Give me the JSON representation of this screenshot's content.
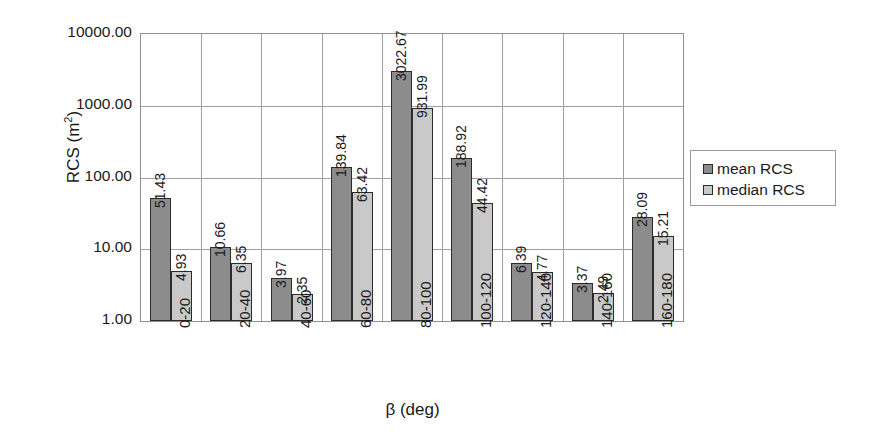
{
  "chart_data": {
    "type": "bar",
    "title": "",
    "subtitle": "",
    "xlabel": "β (deg)",
    "ylabel": "RCS (m²)",
    "ylabel_base": "RCS (m",
    "ylabel_sup": "2",
    "ylabel_close": ")",
    "yscale": "log",
    "ylim": [
      1,
      10000
    ],
    "ytick_labels": [
      "10000.00",
      "1000.00",
      "100.00",
      "10.00",
      "1.00"
    ],
    "ytick_values": [
      10000,
      1000,
      100,
      10,
      1
    ],
    "grid": true,
    "grid_axis": "both",
    "legend_position": "right",
    "categories": [
      "0-20",
      "20-40",
      "40-60",
      "60-80",
      "80-100",
      "100-120",
      "120-140",
      "140-160",
      "160-180"
    ],
    "series": [
      {
        "name": "mean RCS",
        "color": "#8c8c8c",
        "values": [
          51.43,
          10.66,
          3.97,
          139.84,
          3022.67,
          188.92,
          6.39,
          3.37,
          28.09
        ],
        "labels": [
          "51.43",
          "10.66",
          "3.97",
          "139.84",
          "3022.67",
          "188.92",
          "6.39",
          "3.37",
          "28.09"
        ]
      },
      {
        "name": "median RCS",
        "color": "#c9c9c9",
        "values": [
          4.93,
          6.35,
          2.35,
          63.42,
          931.99,
          44.42,
          4.77,
          2.49,
          15.21
        ],
        "labels": [
          "4.93",
          "6.35",
          "2.35",
          "63.42",
          "931.99",
          "44.42",
          "4.77",
          "2.49",
          "15.21"
        ]
      }
    ]
  },
  "legend": {
    "entries": [
      {
        "label": "mean RCS",
        "color": "#8c8c8c"
      },
      {
        "label": "median RCS",
        "color": "#c9c9c9"
      }
    ]
  },
  "colors": {
    "mean": "#8c8c8c",
    "median": "#c9c9c9",
    "axis": "#8f8f8f",
    "grid": "#a0a0a0",
    "bar_outline": "#2b2b2b",
    "background": "#ffffff"
  }
}
